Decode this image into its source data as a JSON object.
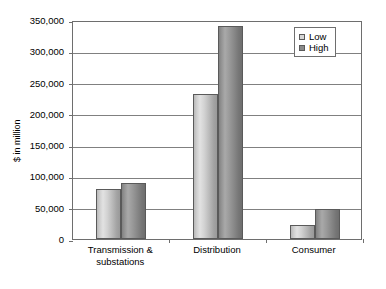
{
  "chart_data": {
    "type": "bar",
    "title": "",
    "subtitle": "",
    "xlabel": "",
    "ylabel": "$ in million",
    "categories": [
      "Transmission & substations",
      "Distribution",
      "Consumer"
    ],
    "series": [
      {
        "name": "Low",
        "values": [
          80000,
          232000,
          22000
        ]
      },
      {
        "name": "High",
        "values": [
          89000,
          340000,
          48000
        ]
      }
    ],
    "ylim": [
      0,
      350000
    ],
    "ytick_values": [
      0,
      50000,
      100000,
      150000,
      200000,
      250000,
      300000,
      350000
    ],
    "ytick_labels": [
      "0",
      "50,000",
      "100,000",
      "150,000",
      "200,000",
      "250,000",
      "300,000",
      "350,000"
    ],
    "grid": true,
    "grid_axis": "y",
    "legend_position": "top-right",
    "legend_entries": [
      "Low",
      "High"
    ],
    "colors": {
      "series_low": "#cccccc",
      "series_high": "#8a8a8a",
      "gridline": "#808080",
      "axis": "#6e6e6e",
      "background": "#ffffff",
      "text": "#000000"
    }
  },
  "axes": {
    "y_title": "$ in million"
  },
  "legend": {
    "items": [
      {
        "label": "Low"
      },
      {
        "label": "High"
      }
    ]
  },
  "x_axis": {
    "categories": [
      {
        "label": "Transmission & substations"
      },
      {
        "label": "Distribution"
      },
      {
        "label": "Consumer"
      }
    ]
  },
  "y_axis": {
    "ticks": [
      {
        "label": "350,000"
      },
      {
        "label": "300,000"
      },
      {
        "label": "250,000"
      },
      {
        "label": "200,000"
      },
      {
        "label": "150,000"
      },
      {
        "label": "100,000"
      },
      {
        "label": "50,000"
      },
      {
        "label": "0"
      }
    ]
  }
}
